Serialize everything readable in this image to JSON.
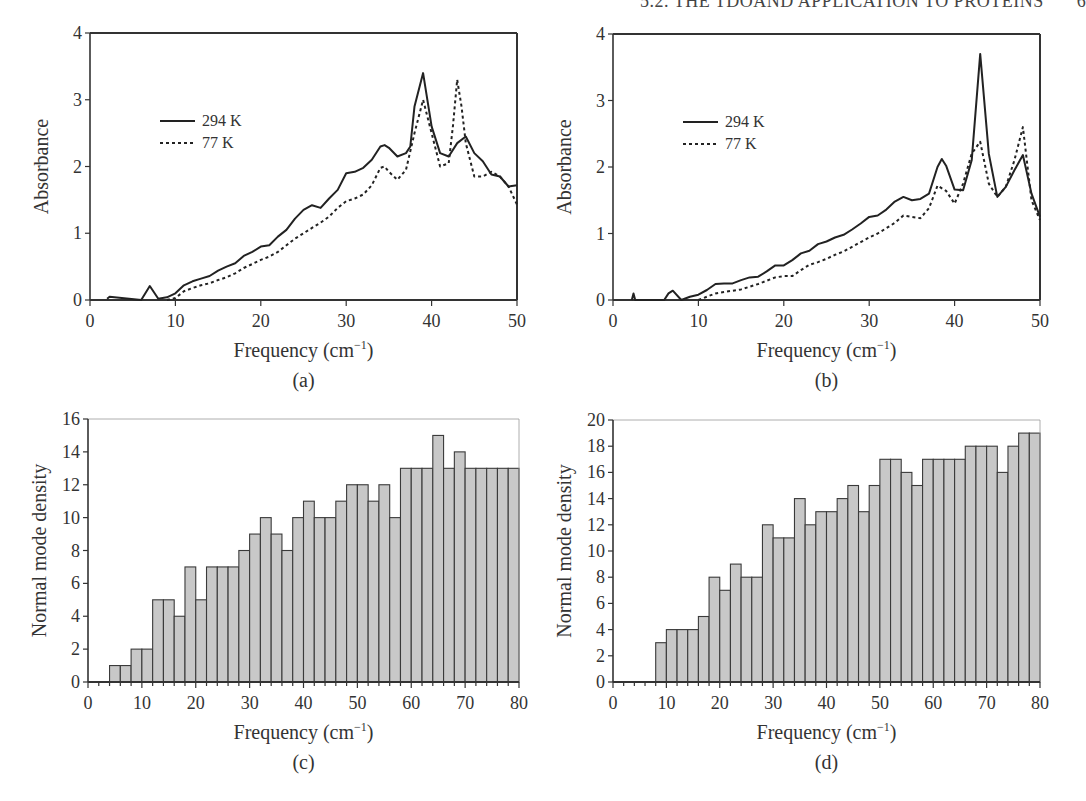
{
  "header": {
    "running_head": "5.2. THE TDOAND APPLICATION TO PROTEINS",
    "page_number": "6"
  },
  "chart_data": [
    {
      "id": "a",
      "type": "line",
      "caption": "(a)",
      "xlabel": "Frequency (cm⁻¹)",
      "ylabel": "Absorbance",
      "xlim": [
        0,
        50
      ],
      "ylim": [
        0,
        4
      ],
      "xticks": [
        0,
        10,
        20,
        30,
        40,
        50
      ],
      "yticks": [
        0,
        1,
        2,
        3,
        4
      ],
      "legend": {
        "position": "upper-left",
        "entries": [
          "294 K",
          "77 K"
        ]
      },
      "series": [
        {
          "name": "294 K",
          "style": "solid",
          "x": [
            2,
            2.3,
            6,
            7,
            8,
            9,
            10,
            11,
            12,
            13,
            14,
            15,
            16,
            17,
            18,
            19,
            20,
            21,
            22,
            23,
            24,
            25,
            26,
            27,
            28,
            29,
            30,
            31,
            32,
            33,
            34,
            34.5,
            35,
            36,
            37,
            37.5,
            38,
            39,
            40,
            41,
            42,
            43,
            44,
            45,
            46,
            47,
            48,
            49,
            50
          ],
          "y": [
            0.02,
            0.05,
            0,
            0.21,
            0.02,
            0.04,
            0.1,
            0.22,
            0.28,
            0.32,
            0.36,
            0.44,
            0.5,
            0.55,
            0.66,
            0.72,
            0.8,
            0.82,
            0.95,
            1.05,
            1.22,
            1.35,
            1.42,
            1.38,
            1.52,
            1.65,
            1.9,
            1.92,
            1.98,
            2.1,
            2.3,
            2.32,
            2.28,
            2.15,
            2.2,
            2.3,
            2.9,
            3.4,
            2.6,
            2.2,
            2.15,
            2.35,
            2.45,
            2.2,
            2.08,
            1.88,
            1.85,
            1.7,
            1.72
          ]
        },
        {
          "name": "77 K",
          "style": "dotted",
          "x": [
            9,
            10,
            11,
            12,
            13,
            14,
            15,
            16,
            17,
            18,
            19,
            20,
            21,
            22,
            23,
            24,
            25,
            26,
            27,
            28,
            29,
            30,
            31,
            32,
            33,
            34,
            34.5,
            35,
            36,
            37,
            38,
            39,
            40,
            41,
            42,
            42.5,
            43,
            43.5,
            44,
            45,
            46,
            47,
            48,
            49,
            50
          ],
          "y": [
            0,
            0.03,
            0.13,
            0.18,
            0.22,
            0.25,
            0.3,
            0.34,
            0.4,
            0.48,
            0.54,
            0.6,
            0.65,
            0.72,
            0.82,
            0.92,
            1.0,
            1.08,
            1.16,
            1.25,
            1.38,
            1.48,
            1.52,
            1.58,
            1.72,
            1.98,
            2.0,
            1.92,
            1.8,
            1.95,
            2.5,
            3.0,
            2.5,
            2.0,
            2.05,
            2.6,
            3.3,
            2.9,
            2.35,
            1.85,
            1.85,
            1.92,
            1.85,
            1.7,
            1.43
          ]
        }
      ]
    },
    {
      "id": "b",
      "type": "line",
      "caption": "(b)",
      "xlabel": "Frequency (cm⁻¹)",
      "ylabel": "Absorbance",
      "xlim": [
        0,
        50
      ],
      "ylim": [
        0,
        4
      ],
      "xticks": [
        0,
        10,
        20,
        30,
        40,
        50
      ],
      "yticks": [
        0,
        1,
        2,
        3,
        4
      ],
      "legend": {
        "position": "upper-left",
        "entries": [
          "294 K",
          "77 K"
        ]
      },
      "series": [
        {
          "name": "294 K",
          "style": "solid",
          "x": [
            2.2,
            2.4,
            2.6,
            6,
            6.5,
            7,
            8,
            9,
            10,
            11,
            12,
            13,
            14,
            15,
            16,
            17,
            18,
            19,
            20,
            21,
            22,
            23,
            24,
            25,
            26,
            27,
            28,
            29,
            30,
            31,
            32,
            33,
            34,
            35,
            36,
            37,
            38,
            38.5,
            39,
            40,
            41,
            42,
            43,
            44,
            45,
            46,
            47,
            48,
            49,
            50
          ],
          "y": [
            0,
            0.1,
            0,
            0,
            0.1,
            0.14,
            0,
            0.05,
            0.08,
            0.15,
            0.24,
            0.25,
            0.25,
            0.3,
            0.34,
            0.35,
            0.43,
            0.52,
            0.52,
            0.6,
            0.7,
            0.74,
            0.84,
            0.88,
            0.94,
            0.98,
            1.06,
            1.15,
            1.25,
            1.27,
            1.36,
            1.48,
            1.55,
            1.5,
            1.52,
            1.6,
            2.0,
            2.12,
            2.02,
            1.66,
            1.65,
            2.1,
            3.7,
            2.2,
            1.55,
            1.7,
            1.95,
            2.18,
            1.6,
            1.25
          ]
        },
        {
          "name": "77 K",
          "style": "dotted",
          "x": [
            10,
            11,
            12,
            13,
            14,
            15,
            16,
            17,
            18,
            19,
            20,
            21,
            22,
            23,
            24,
            25,
            26,
            27,
            28,
            29,
            30,
            31,
            32,
            33,
            34,
            35,
            36,
            37,
            38,
            39,
            40,
            41,
            42,
            43,
            44,
            45,
            46,
            47,
            48,
            49,
            50
          ],
          "y": [
            0,
            0.05,
            0.1,
            0.12,
            0.14,
            0.16,
            0.2,
            0.24,
            0.29,
            0.34,
            0.36,
            0.36,
            0.45,
            0.53,
            0.57,
            0.62,
            0.68,
            0.73,
            0.8,
            0.87,
            0.94,
            1.0,
            1.08,
            1.16,
            1.27,
            1.25,
            1.23,
            1.38,
            1.72,
            1.64,
            1.45,
            1.75,
            2.2,
            2.38,
            1.75,
            1.55,
            1.7,
            2.1,
            2.6,
            1.5,
            1.2
          ]
        }
      ]
    },
    {
      "id": "c",
      "type": "bar",
      "caption": "(c)",
      "xlabel": "Frequency (cm⁻¹)",
      "ylabel": "Normal mode density",
      "xlim": [
        0,
        80
      ],
      "ylim": [
        0,
        16
      ],
      "xticks": [
        0,
        10,
        20,
        30,
        40,
        50,
        60,
        70,
        80
      ],
      "yticks": [
        0,
        2,
        4,
        6,
        8,
        10,
        12,
        14,
        16
      ],
      "bin_width": 2,
      "bin_start": 0,
      "values": [
        0,
        0,
        1,
        1,
        2,
        2,
        5,
        5,
        4,
        7,
        5,
        7,
        7,
        7,
        8,
        9,
        10,
        9,
        8,
        10,
        11,
        10,
        10,
        11,
        12,
        12,
        11,
        12,
        10,
        13,
        13,
        13,
        15,
        13,
        14,
        13,
        13,
        13,
        13,
        13
      ]
    },
    {
      "id": "d",
      "type": "bar",
      "caption": "(d)",
      "xlabel": "Frequency (cm⁻¹)",
      "ylabel": "Normal mode density",
      "xlim": [
        0,
        80
      ],
      "ylim": [
        0,
        20
      ],
      "xticks": [
        0,
        10,
        20,
        30,
        40,
        50,
        60,
        70,
        80
      ],
      "yticks": [
        0,
        2,
        4,
        6,
        8,
        10,
        12,
        14,
        16,
        18,
        20
      ],
      "bin_width": 2,
      "bin_start": 0,
      "values": [
        0,
        0,
        0,
        0,
        3,
        4,
        4,
        4,
        5,
        8,
        7,
        9,
        8,
        8,
        12,
        11,
        11,
        14,
        12,
        13,
        13,
        14,
        15,
        13,
        15,
        17,
        17,
        16,
        15,
        17,
        17,
        17,
        17,
        18,
        18,
        18,
        16,
        18,
        19,
        19
      ]
    }
  ],
  "colors": {
    "bar_fill": "#c8c8c8",
    "bar_stroke": "#3a3a3a",
    "axis": "#333333",
    "line": "#222222"
  }
}
